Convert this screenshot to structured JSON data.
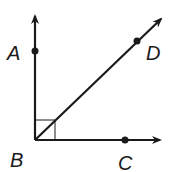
{
  "diagram": {
    "colors": {
      "stroke": "#1a1a1a",
      "background": "#ffffff"
    },
    "vertex": {
      "label": "B",
      "x": 35,
      "y": 140
    },
    "rays": [
      {
        "name": "BA",
        "to": [
          35,
          14
        ],
        "point": {
          "label": "A",
          "x": 35,
          "y": 51
        }
      },
      {
        "name": "BD",
        "to": [
          163,
          17
        ],
        "point": {
          "label": "D",
          "x": 137,
          "y": 41
        }
      },
      {
        "name": "BC",
        "to": [
          162,
          140
        ],
        "point": {
          "label": "C",
          "x": 125,
          "y": 140
        }
      }
    ],
    "right_angle_marker": {
      "between": "BA,BC",
      "size": 20
    },
    "labels": {
      "A": "A",
      "B": "B",
      "C": "C",
      "D": "D"
    }
  }
}
